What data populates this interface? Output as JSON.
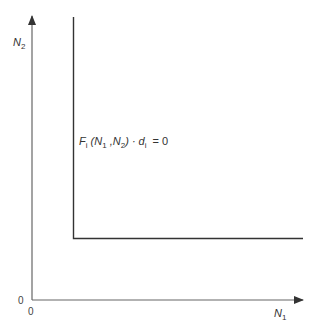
{
  "diagram": {
    "axes": {
      "x_label": {
        "base": "N",
        "sub": "1"
      },
      "y_label": {
        "base": "N",
        "sub": "2"
      },
      "x_origin": "0",
      "y_origin": "0"
    },
    "curve_label": {
      "F": "F",
      "F_sub": "i",
      "args_open": " (N",
      "arg1_sub": "1",
      "comma": " ,N",
      "arg2_sub": "2",
      "close": ") · d",
      "d_sub": "i",
      "eq": "  = 0"
    },
    "colors": {
      "axis": "#555555",
      "curve": "#333333"
    }
  }
}
